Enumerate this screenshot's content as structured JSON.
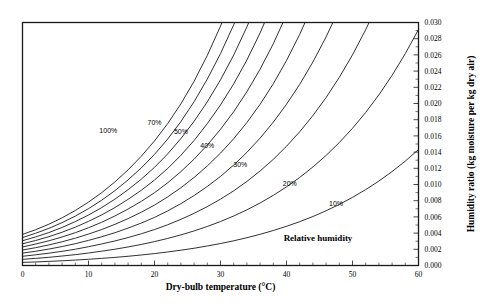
{
  "chart_data": {
    "type": "line",
    "title": "",
    "xlabel": "Dry-bulb temperature (°C)",
    "ylabel": "Humidity ratio (kg moisture per kg dry air)",
    "legend_label": "Relative humidity",
    "xlim": [
      0,
      60
    ],
    "ylim": [
      0,
      0.03
    ],
    "grid": false,
    "legend_position": "inline-curve-labels",
    "xticks": [
      0,
      10,
      20,
      30,
      40,
      50,
      60
    ],
    "xtick_labels": [
      "0",
      "10",
      "20",
      "30",
      "40",
      "50",
      "60"
    ],
    "x_minor_tick_step": 2,
    "yticks": [
      0.0,
      0.002,
      0.004,
      0.006,
      0.008,
      0.01,
      0.012,
      0.014,
      0.016,
      0.018,
      0.02,
      0.022,
      0.024,
      0.026,
      0.028,
      0.03
    ],
    "ytick_labels": [
      "0.000",
      "0.002",
      "0.004",
      "0.006",
      "0.008",
      "0.010",
      "0.012",
      "0.014",
      "0.016",
      "0.018",
      "0.020",
      "0.022",
      "0.024",
      "0.026",
      "0.028",
      "0.030"
    ],
    "y_axis_side": "right",
    "x": [
      0,
      2,
      4,
      6,
      8,
      10,
      12,
      14,
      16,
      18,
      20,
      22,
      24,
      26,
      28,
      30,
      32,
      34,
      36,
      38,
      40,
      42,
      44,
      46,
      48,
      50,
      52,
      54,
      56,
      58,
      60
    ],
    "series": [
      {
        "name": "10%",
        "rh": 10,
        "label_shown": true,
        "label_x": 47.5,
        "label_y": 0.0073,
        "values": [
          0.00038,
          0.00044,
          0.00051,
          0.00058,
          0.00067,
          0.00077,
          0.00088,
          0.001,
          0.00114,
          0.0013,
          0.00147,
          0.00167,
          0.00189,
          0.00213,
          0.00241,
          0.00271,
          0.00305,
          0.00343,
          0.00385,
          0.00432,
          0.00484,
          0.00541,
          0.00605,
          0.00676,
          0.00754,
          0.00841,
          0.00937,
          0.01043,
          0.0116,
          0.01289,
          0.01431
        ]
      },
      {
        "name": "20%",
        "rh": 20,
        "label_shown": true,
        "label_x": 40.5,
        "label_y": 0.0098,
        "values": [
          0.00076,
          0.00088,
          0.00101,
          0.00117,
          0.00134,
          0.00154,
          0.00177,
          0.00201,
          0.00229,
          0.0026,
          0.00295,
          0.00334,
          0.00378,
          0.00427,
          0.00482,
          0.00543,
          0.00611,
          0.00687,
          0.00772,
          0.00866,
          0.00971,
          0.01087,
          0.01216,
          0.01359,
          0.01518,
          0.01694,
          0.0189,
          0.02107,
          0.02348,
          0.02616,
          0.02914
        ]
      },
      {
        "name": "30%",
        "rh": 30,
        "label_shown": true,
        "label_x": 33.0,
        "label_y": 0.0122,
        "values": [
          0.00114,
          0.00132,
          0.00152,
          0.00175,
          0.00201,
          0.00232,
          0.00266,
          0.00303,
          0.00345,
          0.00392,
          0.00444,
          0.00503,
          0.0057,
          0.00644,
          0.00727,
          0.00819,
          0.00922,
          0.01038,
          0.01167,
          0.01311,
          0.01472,
          0.01651,
          0.01851,
          0.02074,
          0.02323,
          0.02601,
          0.02911,
          0.03259,
          0.03648,
          0.04084,
          0.04573
        ]
      },
      {
        "name": "40%",
        "rh": 40,
        "label_shown": true,
        "label_x": 28.0,
        "label_y": 0.0145,
        "values": [
          0.00153,
          0.00176,
          0.00203,
          0.00234,
          0.00269,
          0.0031,
          0.00355,
          0.00405,
          0.00462,
          0.00524,
          0.00594,
          0.00674,
          0.00764,
          0.00864,
          0.00976,
          0.011,
          0.0124,
          0.01397,
          0.01573,
          0.0177,
          0.0199,
          0.02236,
          0.02512,
          0.02822,
          0.0317,
          0.03561,
          0.04001,
          0.04497,
          0.05058,
          0.05692,
          0.06412
        ]
      },
      {
        "name": "50%",
        "rh": 50,
        "label_shown": true,
        "label_x": 24.0,
        "label_y": 0.0162,
        "values": [
          0.00191,
          0.0022,
          0.00254,
          0.00293,
          0.00337,
          0.00388,
          0.00444,
          0.00508,
          0.00579,
          0.00658,
          0.00746,
          0.00847,
          0.0096,
          0.01087,
          0.01229,
          0.01387,
          0.01565,
          0.01765,
          0.0199,
          0.02244,
          0.0253,
          0.02853,
          0.03218,
          0.03632,
          0.04101,
          0.04634,
          0.05242,
          0.05937,
          0.06734,
          0.07651,
          0.08711
        ]
      },
      {
        "name": "60%",
        "rh": 60,
        "label_shown": false,
        "label_x": null,
        "label_y": null,
        "values": [
          0.00229,
          0.00265,
          0.00305,
          0.00352,
          0.00405,
          0.00466,
          0.00534,
          0.00611,
          0.00697,
          0.00792,
          0.00899,
          0.01021,
          0.01159,
          0.01313,
          0.01487,
          0.01681,
          0.01899,
          0.02145,
          0.02423,
          0.02738,
          0.03095,
          0.035,
          0.0396,
          0.04485,
          0.05084,
          0.05771,
          0.06562,
          0.07476,
          0.08536,
          0.09772,
          0.11221
        ]
      },
      {
        "name": "70%",
        "rh": 70,
        "label_shown": true,
        "label_x": 20.0,
        "label_y": 0.0173,
        "values": [
          0.00268,
          0.00309,
          0.00356,
          0.00411,
          0.00473,
          0.00545,
          0.00625,
          0.00715,
          0.00817,
          0.00929,
          0.01055,
          0.01198,
          0.01361,
          0.01544,
          0.01751,
          0.01982,
          0.02242,
          0.02537,
          0.02871,
          0.03252,
          0.03686,
          0.04182,
          0.0475,
          0.05404,
          0.0616,
          0.07037,
          0.0806,
          0.0926,
          0.10676,
          0.1236,
          0.1438
        ]
      },
      {
        "name": "80%",
        "rh": 80,
        "label_shown": false,
        "label_x": null,
        "label_y": null,
        "values": [
          0.00306,
          0.00353,
          0.00407,
          0.0047,
          0.00542,
          0.00623,
          0.00715,
          0.00819,
          0.00936,
          0.01066,
          0.01212,
          0.01378,
          0.01567,
          0.0178,
          0.02021,
          0.02292,
          0.02598,
          0.02945,
          0.0334,
          0.03793,
          0.04313,
          0.0491,
          0.05599,
          0.06398,
          0.07331,
          0.08428,
          0.09728,
          0.11283,
          0.13163,
          0.15462,
          0.18314
        ]
      },
      {
        "name": "90%",
        "rh": 90,
        "label_shown": false,
        "label_x": null,
        "label_y": null,
        "values": [
          0.00345,
          0.00398,
          0.00459,
          0.00529,
          0.0061,
          0.00702,
          0.00806,
          0.00924,
          0.01057,
          0.01205,
          0.01372,
          0.01561,
          0.01777,
          0.02022,
          0.02301,
          0.02616,
          0.02971,
          0.03377,
          0.03843,
          0.04381,
          0.05004,
          0.05728,
          0.06572,
          0.07563,
          0.08734,
          0.10132,
          0.11818,
          0.1388,
          0.16438,
          0.19669,
          0.23838
        ]
      },
      {
        "name": "100%",
        "rh": 100,
        "label_shown": true,
        "label_x": 13.0,
        "label_y": 0.0163,
        "values": [
          0.00384,
          0.00442,
          0.0051,
          0.00589,
          0.00679,
          0.00783,
          0.00899,
          0.01032,
          0.01181,
          0.01349,
          0.01538,
          0.01752,
          0.01996,
          0.02275,
          0.02594,
          0.02955,
          0.03365,
          0.03834,
          0.04376,
          0.05004,
          0.05739,
          0.06601,
          0.07622,
          0.08842,
          0.10315,
          0.12113,
          0.14334,
          0.17124,
          0.20705,
          0.25425,
          0.31905
        ]
      }
    ]
  }
}
